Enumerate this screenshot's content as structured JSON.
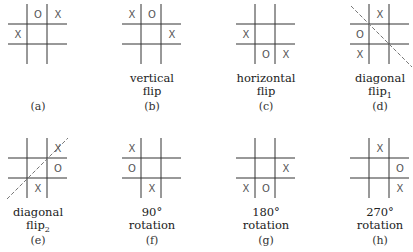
{
  "grid": {
    "line_color": "#333333",
    "mark_color": "#555555",
    "diag_color": "#777777"
  },
  "panels": [
    {
      "id": "a",
      "label": "(a)",
      "caption": [],
      "cells": [
        "",
        "O",
        "X",
        "X",
        "",
        "",
        "",
        "",
        ""
      ],
      "diagonal": "none"
    },
    {
      "id": "b",
      "label": "(b)",
      "caption": [
        "vertical",
        "flip"
      ],
      "cells": [
        "X",
        "O",
        "",
        "",
        "",
        "X",
        "",
        "",
        ""
      ],
      "diagonal": "none"
    },
    {
      "id": "c",
      "label": "(c)",
      "caption": [
        "horizontal",
        "flip"
      ],
      "cells": [
        "",
        "",
        "",
        "X",
        "",
        "",
        "",
        "O",
        "X"
      ],
      "diagonal": "none"
    },
    {
      "id": "d",
      "label": "(d)",
      "caption": [
        "diagonal",
        "flip",
        "1"
      ],
      "cells": [
        "",
        "X",
        "",
        "O",
        "",
        "",
        "X",
        "",
        ""
      ],
      "diagonal": "main"
    },
    {
      "id": "e",
      "label": "(e)",
      "caption": [
        "diagonal",
        "flip",
        "2"
      ],
      "cells": [
        "",
        "",
        "X",
        "",
        "",
        "O",
        "",
        "X",
        ""
      ],
      "diagonal": "anti"
    },
    {
      "id": "f",
      "label": "(f)",
      "caption": [
        "90°",
        "rotation"
      ],
      "cells": [
        "X",
        "",
        "",
        "O",
        "",
        "",
        "",
        "X",
        ""
      ],
      "diagonal": "none"
    },
    {
      "id": "g",
      "label": "(g)",
      "caption": [
        "180°",
        "rotation"
      ],
      "cells": [
        "",
        "",
        "",
        "",
        "",
        "X",
        "X",
        "O",
        ""
      ],
      "diagonal": "none"
    },
    {
      "id": "h",
      "label": "(h)",
      "caption": [
        "270°",
        "rotation"
      ],
      "cells": [
        "",
        "X",
        "",
        "",
        "",
        "O",
        "",
        "",
        "X"
      ],
      "diagonal": "none"
    }
  ]
}
